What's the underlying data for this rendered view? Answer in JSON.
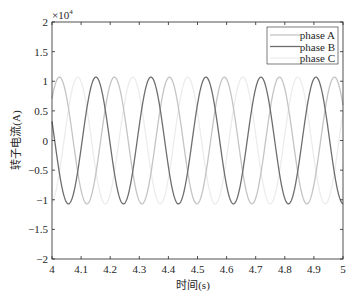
{
  "chart_data": {
    "type": "line",
    "title": "",
    "xlabel": "时间(s)",
    "ylabel": "转子电流(A)",
    "y_scale_label": "×10",
    "y_scale_exponent": "4",
    "xlim": [
      4,
      5
    ],
    "ylim": [
      -2,
      2
    ],
    "y_multiplier": 10000,
    "xticks": [
      4,
      4.1,
      4.2,
      4.3,
      4.4,
      4.5,
      4.6,
      4.7,
      4.8,
      4.9,
      5
    ],
    "xtick_labels": [
      "4",
      "4.1",
      "4.2",
      "4.3",
      "4.4",
      "4.5",
      "4.6",
      "4.7",
      "4.8",
      "4.9",
      "5"
    ],
    "yticks": [
      -2,
      -1.5,
      -1,
      -0.5,
      0,
      0.5,
      1,
      1.5,
      2
    ],
    "ytick_labels": [
      "−2",
      "−1.5",
      "−1",
      "−0.5",
      "0",
      "0.5",
      "1",
      "1.5",
      "2"
    ],
    "grid": false,
    "legend_position": "upper right",
    "waveform": {
      "form": "sinusoid",
      "amplitude": 1.07,
      "period_s": 0.189,
      "frequency_hz": 5.29
    },
    "series": [
      {
        "name": "phase A",
        "color": "#c4c4c4",
        "peak_time_s": 4.0255,
        "phase_deg": 120
      },
      {
        "name": "phase B",
        "color": "#6e6e6e",
        "peak_time_s": 4.151,
        "phase_deg": 0
      },
      {
        "name": "phase C",
        "color": "#ececec",
        "peak_time_s": 4.0885,
        "phase_deg": -120
      }
    ]
  }
}
